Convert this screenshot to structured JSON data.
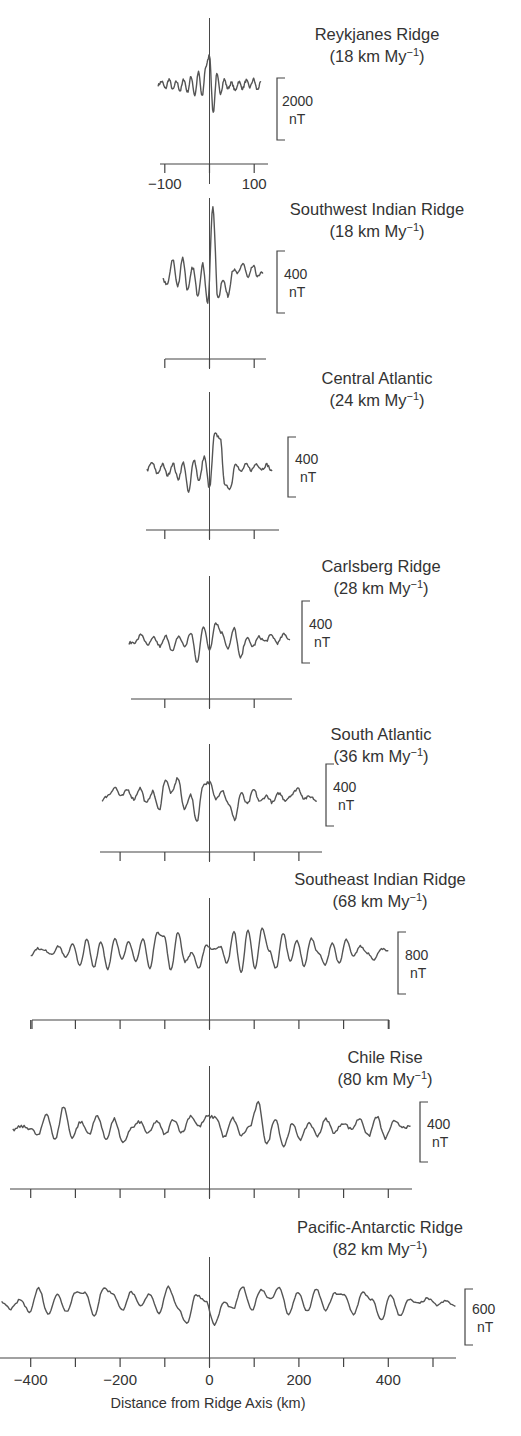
{
  "chart_data": {
    "type": "line",
    "xlabel": "Distance from Ridge Axis (km)",
    "ylabel": "Magnetic anomaly (nT)",
    "x_ticks": [
      -400,
      -200,
      0,
      200,
      400
    ],
    "grid": false,
    "legend": "none",
    "series": [
      {
        "name": "Reykjanes Ridge",
        "rate_label": "(18 km My",
        "rate_value": 18,
        "scale_bar": "2000",
        "scale_unit": "nT",
        "xlim": [
          -115,
          115
        ],
        "tick_labels": [
          "-100",
          "100"
        ],
        "ticks": [
          -100,
          0,
          100
        ],
        "values": [
          0,
          300,
          -300,
          500,
          -400,
          300,
          -500,
          500,
          -600,
          700,
          -900,
          1100,
          -1000,
          1600,
          2600,
          -2400,
          900,
          -700,
          500,
          -300,
          200,
          -500,
          300,
          -300,
          400,
          -200,
          500,
          -400,
          200
        ]
      },
      {
        "name": "Southwest Indian Ridge",
        "rate_label": "(18 km My",
        "rate_value": 18,
        "scale_bar": "400",
        "scale_unit": "nT",
        "xlim": [
          -105,
          120
        ],
        "ticks": [
          -100,
          0,
          100
        ],
        "values": [
          0,
          -40,
          200,
          -60,
          210,
          -100,
          120,
          -140,
          150,
          -220,
          700,
          -180,
          10,
          -150,
          100,
          60,
          160,
          20,
          130,
          30,
          80
        ]
      },
      {
        "name": "Central Atlantic",
        "rate_label": "(24 km My",
        "rate_value": 24,
        "scale_bar": "400",
        "scale_unit": "nT",
        "xlim": [
          -140,
          140
        ],
        "ticks": [
          -100,
          0,
          100
        ],
        "values": [
          0,
          80,
          -40,
          60,
          -60,
          70,
          -100,
          80,
          -250,
          120,
          -120,
          150,
          -200,
          400,
          360,
          -180,
          -200,
          80,
          -20,
          60,
          0,
          70,
          10,
          60,
          -20
        ]
      },
      {
        "name": "Carlsberg Ridge",
        "rate_label": "(28 km My",
        "rate_value": 28,
        "scale_bar": "400",
        "scale_unit": "nT",
        "xlim": [
          -180,
          180
        ],
        "ticks": [
          -100,
          0,
          100
        ],
        "values": [
          0,
          10,
          100,
          -30,
          60,
          -40,
          80,
          -100,
          80,
          -40,
          120,
          -230,
          200,
          -80,
          240,
          120,
          -60,
          170,
          -180,
          60,
          -40,
          70,
          20,
          90,
          0,
          100,
          40
        ]
      },
      {
        "name": "South Atlantic",
        "rate_label": "(36 km My",
        "rate_value": 36,
        "scale_bar": "400",
        "scale_unit": "nT",
        "xlim": [
          -240,
          240
        ],
        "ticks": [
          -200,
          -100,
          0,
          100,
          200
        ],
        "values": [
          0,
          60,
          150,
          40,
          120,
          10,
          140,
          -40,
          100,
          -120,
          240,
          80,
          260,
          -110,
          60,
          -250,
          180,
          210,
          10,
          120,
          -40,
          -230,
          80,
          -50,
          120,
          -20,
          50,
          -30,
          80,
          0,
          60,
          140,
          20,
          40,
          -10
        ]
      },
      {
        "name": "Southeast Indian Ridge",
        "rate_label": "(68 km My",
        "rate_value": 68,
        "scale_bar": "800",
        "scale_unit": "nT",
        "xlim": [
          -400,
          400
        ],
        "ticks": [
          -400,
          -300,
          -200,
          -100,
          0,
          100,
          200,
          300,
          400
        ],
        "values": [
          0,
          120,
          80,
          20,
          160,
          -50,
          210,
          -200,
          280,
          -220,
          240,
          -250,
          290,
          -60,
          250,
          -130,
          300,
          -250,
          400,
          350,
          -280,
          420,
          -120,
          40,
          -250,
          180,
          100,
          160,
          -150,
          420,
          -320,
          460,
          -260,
          480,
          80,
          -240,
          400,
          -100,
          260,
          -200,
          300,
          40,
          -180,
          220,
          -160,
          280,
          -30,
          160,
          40,
          -80,
          120,
          60
        ]
      },
      {
        "name": "Chile Rise",
        "rate_label": "(80 km My",
        "rate_value": 80,
        "scale_bar": "400",
        "scale_unit": "nT",
        "xlim": [
          -440,
          450
        ],
        "ticks": [
          -400,
          -300,
          -200,
          -100,
          0,
          100,
          200,
          300,
          400
        ],
        "values": [
          0,
          40,
          20,
          -60,
          180,
          -110,
          260,
          -80,
          90,
          -40,
          160,
          -100,
          120,
          -150,
          20,
          90,
          -40,
          100,
          -50,
          120,
          -30,
          160,
          40,
          150,
          140,
          -80,
          130,
          -60,
          40,
          300,
          -160,
          130,
          -180,
          60,
          -100,
          80,
          -60,
          120,
          -30,
          80,
          10,
          130,
          -70,
          150,
          -90,
          90,
          40,
          30
        ]
      },
      {
        "name": "Pacific-Antarctic Ridge",
        "rate_label": "(82 km My",
        "rate_value": 82,
        "scale_bar": "600",
        "scale_unit": "nT",
        "xlim": [
          -465,
          550
        ],
        "ticks": [
          -400,
          -300,
          -200,
          -100,
          0,
          100,
          200,
          300,
          400,
          500
        ],
        "values": [
          40,
          -60,
          80,
          -100,
          260,
          -140,
          160,
          -100,
          200,
          190,
          -160,
          260,
          180,
          -80,
          200,
          -20,
          170,
          -120,
          280,
          -40,
          -280,
          160,
          70,
          -300,
          40,
          -60,
          280,
          -80,
          240,
          100,
          260,
          -140,
          200,
          -100,
          240,
          -80,
          180,
          150,
          -140,
          190,
          80,
          -240,
          160,
          -160,
          80,
          20,
          100,
          0,
          60,
          -20
        ]
      }
    ]
  },
  "labels": {
    "xlabel": "Distance from Ridge Axis (km)",
    "ticks_bottom": [
      "-400",
      "-200",
      "0",
      "200",
      "400"
    ],
    "unit_superscript": "-1",
    "unit_close": ")"
  }
}
